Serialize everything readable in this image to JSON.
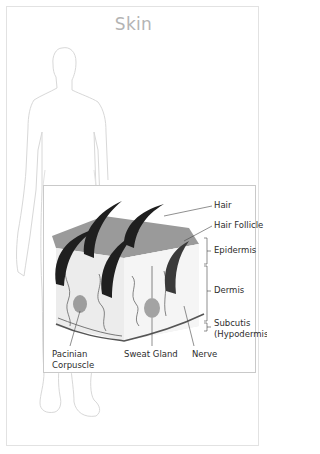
{
  "title": "Skin",
  "diagram": {
    "labels": {
      "hair": "Hair",
      "hair_follicle": "Hair Follicle",
      "epidermis": "Epidermis",
      "dermis": "Dermis",
      "subcutis_line1": "Subcutis",
      "subcutis_line2": "(Hypodermis)",
      "pacinian_line1": "Pacinian",
      "pacinian_line2": "Corpuscle",
      "sweat_gland": "Sweat Gland",
      "nerve": "Nerve"
    },
    "colors": {
      "hair": "#1f1f1f",
      "epidermis_top": "#8a8a8a",
      "dermis": "#e9e9e9",
      "gland": "#9a9a9a",
      "outline": "#d6d6d6"
    }
  }
}
